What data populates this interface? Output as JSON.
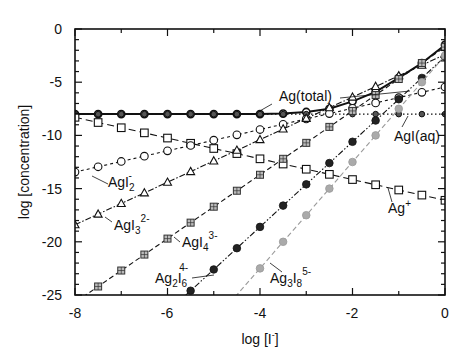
{
  "chart_data": {
    "type": "line",
    "title": "",
    "xlabel": "log [I⁻]",
    "ylabel": "log  [concentration]",
    "xlim": [
      -8,
      0
    ],
    "ylim": [
      -25,
      0
    ],
    "xticks": [
      -8,
      -6,
      -4,
      -2,
      0
    ],
    "yticks": [
      0,
      -5,
      -10,
      -15,
      -20,
      -25
    ],
    "grid": false,
    "legend": "inline labels",
    "x": [
      -8,
      -7.5,
      -7,
      -6.5,
      -6,
      -5.5,
      -5,
      -4.5,
      -4,
      -3.5,
      -3,
      -2.5,
      -2,
      -1.5,
      -1,
      -0.5,
      0
    ],
    "series": [
      {
        "name": "Ag(total)",
        "marker": "filled-circle-open",
        "dash": "solid",
        "color": "#111111",
        "values": [
          -8.0,
          -8.0,
          -8.0,
          -8.0,
          -8.0,
          -8.0,
          -8.0,
          -8.0,
          -8.0,
          -7.95,
          -7.8,
          -7.5,
          -6.8,
          -5.9,
          -4.6,
          -3.2,
          -1.5
        ]
      },
      {
        "name": "AgI(aq)",
        "marker": "dot-circle",
        "dash": "dotted",
        "color": "#111111",
        "values": [
          -8.0,
          -8.0,
          -8.0,
          -8.0,
          -8.0,
          -8.0,
          -8.0,
          -8.0,
          -8.0,
          -8.0,
          -8.0,
          -8.0,
          -8.0,
          -8.0,
          -8.0,
          -8.0,
          -8.0
        ]
      },
      {
        "name": "Ag+",
        "marker": "square",
        "dash": "longdash",
        "color": "#111111",
        "values": [
          -8.3,
          -8.79,
          -9.28,
          -9.76,
          -10.25,
          -10.74,
          -11.23,
          -11.71,
          -12.2,
          -12.69,
          -13.18,
          -13.66,
          -14.15,
          -14.64,
          -15.13,
          -15.61,
          -16.1
        ]
      },
      {
        "name": "AgI2-",
        "marker": "circle",
        "dash": "shortdash",
        "color": "#111111",
        "values": [
          -13.45,
          -12.95,
          -12.45,
          -11.95,
          -11.45,
          -10.95,
          -10.45,
          -9.95,
          -9.45,
          -8.95,
          -8.45,
          -7.95,
          -7.45,
          -6.95,
          -6.45,
          -5.95,
          -5.45
        ]
      },
      {
        "name": "AgI3 2-",
        "marker": "triangle",
        "dash": "dashdot",
        "color": "#111111",
        "values": [
          -18.4,
          -17.4,
          -16.4,
          -15.4,
          -14.4,
          -13.4,
          -12.4,
          -11.4,
          -10.4,
          -9.4,
          -8.4,
          -7.4,
          -6.4,
          -5.4,
          -4.4,
          -3.4,
          -2.4
        ]
      },
      {
        "name": "AgI4 3-",
        "marker": "hatched-square",
        "dash": "dashed",
        "color": "#111111",
        "values": [
          null,
          -24.2,
          -22.7,
          -21.2,
          -19.7,
          -18.2,
          -16.7,
          -15.2,
          -13.7,
          -12.2,
          -10.7,
          -9.2,
          -7.7,
          -6.2,
          -4.7,
          -3.2,
          -1.7
        ]
      },
      {
        "name": "Ag2I6 4-",
        "marker": "filled-hexagon",
        "dash": "dashdotdot",
        "color": "#111111",
        "values": [
          null,
          null,
          null,
          null,
          null,
          -24.6,
          -22.6,
          -20.6,
          -18.6,
          -16.6,
          -14.6,
          -12.6,
          -10.6,
          -8.6,
          -6.6,
          -4.6,
          -2.6
        ]
      },
      {
        "name": "Ag3I8 5-",
        "marker": "filled-circle-gray",
        "dash": "dashed",
        "color": "#9a9a9a",
        "values": [
          null,
          null,
          null,
          null,
          null,
          null,
          null,
          null,
          -22.5,
          -20.0,
          -17.5,
          -15.0,
          -12.5,
          -10.0,
          -7.5,
          -5.0,
          -2.5
        ]
      }
    ],
    "annotations": [
      {
        "text": "Ag(total)",
        "x": -2.4,
        "y": -6.6
      },
      {
        "text": "AgI(aq)",
        "x": -1.2,
        "y": -10.5
      },
      {
        "text": "AgI2-",
        "x": -7.0,
        "y": -14.7
      },
      {
        "text": "AgI3 2-",
        "x": -6.9,
        "y": -19.2
      },
      {
        "text": "AgI4 3-",
        "x": -5.1,
        "y": -21.5
      },
      {
        "text": "Ag2I6 4-",
        "x": -6.5,
        "y": -24.3
      },
      {
        "text": "Ag3I8 5-",
        "x": -3.4,
        "y": -24.3
      },
      {
        "text": "Ag+",
        "x": -1.3,
        "y": -18.7
      }
    ]
  },
  "axes": {
    "xlabel_main": "log [I",
    "xlabel_sup": "-",
    "xlabel_end": "]",
    "ylabel": "log  [concentration]",
    "xtick_labels": [
      "-8",
      "-6",
      "-4",
      "-2",
      "0"
    ],
    "ytick_labels": [
      "0",
      "-5",
      "-10",
      "-15",
      "-20",
      "-25"
    ]
  },
  "labels": {
    "total": "Ag(total)",
    "agi_aq": "AgI(aq)",
    "agi2": {
      "base": "AgI",
      "sub": "2",
      "sup": "-"
    },
    "agi3": {
      "base": "AgI",
      "sub": "3",
      "sup": "2-"
    },
    "agi4": {
      "base": "AgI",
      "sub": "4",
      "sup": "3-"
    },
    "ag2i6": {
      "base1": "Ag",
      "sub1": "2",
      "base2": "I",
      "sub2": "6",
      "sup": "4-"
    },
    "ag3i8": {
      "base1": "Ag",
      "sub1": "3",
      "base2": "I",
      "sub2": "8",
      "sup": "5-"
    },
    "agp": {
      "base": "Ag",
      "sup": "+"
    }
  }
}
